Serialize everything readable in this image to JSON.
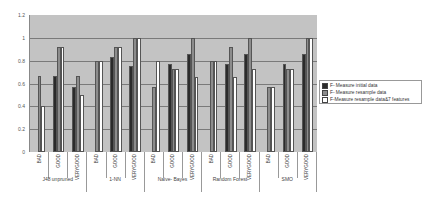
{
  "chart_data": {
    "type": "bar",
    "title": "",
    "xlabel": "",
    "ylabel": "",
    "ylim": [
      0,
      1.2
    ],
    "yticks": [
      "1.2",
      "1",
      "0.8",
      "0.6",
      "0.4",
      "0.2",
      "0"
    ],
    "grid": true,
    "legend_position": "right",
    "groups": [
      "J48 unpruned",
      "1-NN",
      "Naive- Bayes",
      "Random Forest",
      "SMO"
    ],
    "categories": [
      "BAD",
      "GOOD",
      "VERYGOOD",
      "BAD",
      "GOOD",
      "VERYGOOD",
      "BAD",
      "GOOD",
      "VERYGOOD",
      "BAD",
      "GOOD",
      "VERYGOOD",
      "BAD",
      "GOOD",
      "VERYGOOD"
    ],
    "series": [
      {
        "name": "F- Measure initial data",
        "color": "#2b2b2b",
        "values": [
          0,
          0.67,
          0.57,
          0,
          0.83,
          0.75,
          0,
          0.77,
          0.86,
          0,
          0.77,
          0.86,
          0,
          0.77,
          0.86
        ]
      },
      {
        "name": "F- Measure resample data",
        "color": "#8c8c8c",
        "values": [
          0.67,
          0.92,
          0.67,
          0.8,
          0.92,
          1.0,
          0.57,
          0.73,
          1.0,
          0.8,
          0.92,
          1.0,
          0.57,
          0.73,
          1.0
        ]
      },
      {
        "name": "F-Measure resample data&7 features",
        "color": "#ffffff",
        "values": [
          0.4,
          0.92,
          0.5,
          0.8,
          0.92,
          1.0,
          0.8,
          0.73,
          0.66,
          0.8,
          0.66,
          0.73,
          0.57,
          0.73,
          1.0
        ]
      }
    ]
  }
}
